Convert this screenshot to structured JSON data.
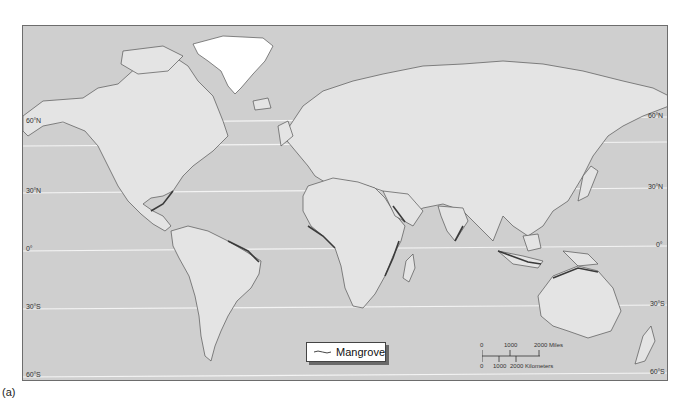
{
  "map": {
    "colors": {
      "ocean": "#cfcfcf",
      "land": "#e4e4e4",
      "coast": "#555555",
      "mangrove": "#3a3a3a",
      "greenland": "#ffffff",
      "gridline": "#f4f4f4"
    },
    "latitude_labels_left": [
      {
        "label": "60°N",
        "y": 122
      },
      {
        "label": "30°N",
        "y": 192
      },
      {
        "label": "0°",
        "y": 250
      },
      {
        "label": "30°S",
        "y": 308
      },
      {
        "label": "60°S",
        "y": 376
      }
    ],
    "latitude_labels_right": [
      {
        "label": "60°N",
        "y": 116
      },
      {
        "label": "30°N",
        "y": 187
      },
      {
        "label": "0°",
        "y": 245
      },
      {
        "label": "30°S",
        "y": 304
      },
      {
        "label": "60°S",
        "y": 372
      }
    ]
  },
  "legend": {
    "label": "Mangrove"
  },
  "scale": {
    "miles": [
      "0",
      "1000",
      "2000 Miles"
    ],
    "kilometers": [
      "0",
      "1000",
      "2000 Kilometers"
    ]
  },
  "caption": "(a)"
}
